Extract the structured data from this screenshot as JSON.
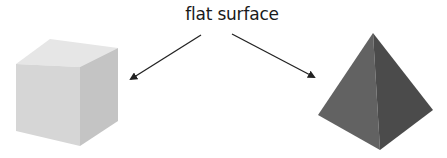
{
  "diagram": {
    "label": "flat surface",
    "shapes": [
      {
        "name": "cube",
        "faces": {
          "top": "#e6e6e6",
          "front": "#d6d6d6",
          "side": "#c4c4c4"
        }
      },
      {
        "name": "pyramid",
        "faces": {
          "left": "#626262",
          "right": "#4b4b4b"
        }
      }
    ],
    "arrows": [
      {
        "from": "label",
        "to": "cube"
      },
      {
        "from": "label",
        "to": "pyramid"
      }
    ],
    "arrow_color": "#222222"
  }
}
